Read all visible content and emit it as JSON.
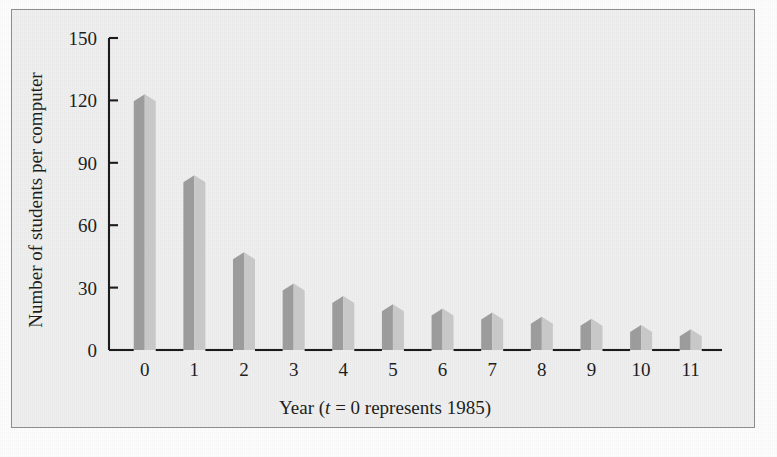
{
  "figure": {
    "background_color": "#efefef",
    "border_color": "#8e8e8e",
    "page_color": "#fdfdfd"
  },
  "chart_data": {
    "type": "bar",
    "title": "",
    "subtitle": "",
    "xlabel_parts": {
      "before": "Year (",
      "italic": "t",
      "after": " = 0 represents 1985)"
    },
    "xlabel": "Year (t = 0 represents 1985)",
    "ylabel": "Number of students per computer",
    "categories": [
      "0",
      "1",
      "2",
      "3",
      "4",
      "5",
      "6",
      "7",
      "8",
      "9",
      "10",
      "11"
    ],
    "values": [
      123,
      84,
      47,
      32,
      26,
      22,
      20,
      18,
      16,
      15,
      12,
      10
    ],
    "xlim": [
      -0.75,
      11.75
    ],
    "ylim": [
      0,
      150
    ],
    "ytick_labels": [
      "0",
      "30",
      "60",
      "90",
      "120",
      "150"
    ],
    "ytick_values": [
      0,
      30,
      60,
      90,
      120,
      150
    ],
    "xtick_labels": [
      "0",
      "1",
      "2",
      "3",
      "4",
      "5",
      "6",
      "7",
      "8",
      "9",
      "10",
      "11"
    ],
    "grid": false,
    "legend": false,
    "legend_position": "none",
    "bar_style": "3d-folded",
    "bar_color_left": "#9d9d9d",
    "bar_color_right": "#c9c9c9",
    "axis_color": "#1a1a1a",
    "annotations": []
  }
}
